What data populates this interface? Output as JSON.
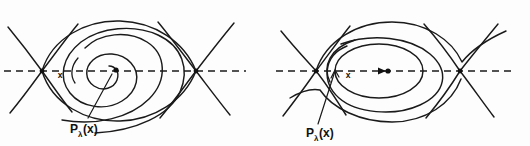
{
  "figure": {
    "background_color": "#fdfdfd",
    "ink_color": "#1a1a1a",
    "panels": [
      {
        "id": "left-panel",
        "description": "Homoclinic/heteroclinic region with inward spiral focus",
        "orbit_type": "spiral",
        "axis_label": "dashed-horizontal-axis",
        "point_label_x": "x",
        "map_label_p": "P",
        "map_label_subscript": "λ",
        "map_label_arg": "(x)",
        "equilibrium_count": 2,
        "center_marker": "filled-dot"
      },
      {
        "id": "right-panel",
        "description": "Heteroclinic region with nested closed orbits around a center",
        "orbit_type": "closed-orbits",
        "axis_label": "dashed-horizontal-axis",
        "point_label_x": "x",
        "map_label_p": "P",
        "map_label_subscript": "λ",
        "map_label_arg": "(x)",
        "equilibrium_count": 2,
        "center_marker": "filled-dot"
      }
    ]
  }
}
